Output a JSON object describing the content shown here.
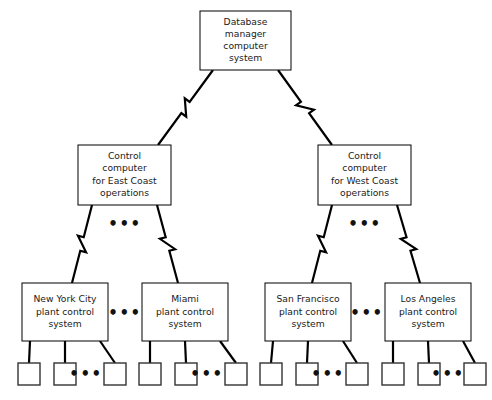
{
  "diagram": {
    "type": "tree-hierarchy",
    "colors": {
      "background": "#ffffff",
      "box_stroke": "#000000",
      "link_stroke": "#000000",
      "text": "#1a1a1a"
    },
    "levels": [
      {
        "level": 1,
        "nodes": [
          {
            "id": "db-manager",
            "name": "database-manager-node",
            "lines": [
              "Database",
              "manager",
              "computer",
              "system"
            ],
            "x": 200,
            "y": 11,
            "w": 91,
            "h": 59
          }
        ]
      },
      {
        "level": 2,
        "nodes": [
          {
            "id": "control-east",
            "name": "control-computer-east-coast-node",
            "lines": [
              "Control",
              "computer",
              "for East Coast",
              "operations"
            ],
            "x": 78,
            "y": 145,
            "w": 93,
            "h": 60
          },
          {
            "id": "control-west",
            "name": "control-computer-west-coast-node",
            "lines": [
              "Control",
              "computer",
              "for West Coast",
              "operations"
            ],
            "x": 318,
            "y": 145,
            "w": 93,
            "h": 60
          }
        ]
      },
      {
        "level": 3,
        "nodes": [
          {
            "id": "plant-nyc",
            "name": "plant-control-new-york-city-node",
            "lines": [
              "New York City",
              "plant control",
              "system"
            ],
            "x": 22,
            "y": 283,
            "w": 86,
            "h": 58
          },
          {
            "id": "plant-miami",
            "name": "plant-control-miami-node",
            "lines": [
              "Miami",
              "plant control",
              "system"
            ],
            "x": 142,
            "y": 283,
            "w": 86,
            "h": 58
          },
          {
            "id": "plant-sf",
            "name": "plant-control-san-francisco-node",
            "lines": [
              "San Francisco",
              "plant control",
              "system"
            ],
            "x": 265,
            "y": 283,
            "w": 86,
            "h": 58
          },
          {
            "id": "plant-la",
            "name": "plant-control-los-angeles-node",
            "lines": [
              "Los Angeles",
              "plant control",
              "system"
            ],
            "x": 385,
            "y": 283,
            "w": 86,
            "h": 58
          }
        ]
      }
    ],
    "leaf_groups": [
      {
        "parent": "plant-nyc",
        "name": "leaf-group-new-york-city",
        "squares": [
          {
            "x": 18,
            "y": 363,
            "size": 22
          },
          {
            "x": 54,
            "y": 363,
            "size": 22
          },
          {
            "x": 104,
            "y": 363,
            "size": 22
          }
        ],
        "ellipsis": {
          "x": 86,
          "y": 374,
          "text": "•••"
        }
      },
      {
        "parent": "plant-miami",
        "name": "leaf-group-miami",
        "squares": [
          {
            "x": 139,
            "y": 363,
            "size": 22
          },
          {
            "x": 175,
            "y": 363,
            "size": 22
          },
          {
            "x": 225,
            "y": 363,
            "size": 22
          }
        ],
        "ellipsis": {
          "x": 207,
          "y": 374,
          "text": "•••"
        }
      },
      {
        "parent": "plant-sf",
        "name": "leaf-group-san-francisco",
        "squares": [
          {
            "x": 260,
            "y": 363,
            "size": 22
          },
          {
            "x": 296,
            "y": 363,
            "size": 22
          },
          {
            "x": 346,
            "y": 363,
            "size": 22
          }
        ],
        "ellipsis": {
          "x": 328,
          "y": 374,
          "text": "•••"
        }
      },
      {
        "parent": "plant-la",
        "name": "leaf-group-los-angeles",
        "squares": [
          {
            "x": 382,
            "y": 363,
            "size": 22
          },
          {
            "x": 418,
            "y": 363,
            "size": 22
          },
          {
            "x": 464,
            "y": 363,
            "size": 22
          }
        ],
        "ellipsis": {
          "x": 448,
          "y": 374,
          "text": "•••"
        }
      }
    ],
    "ellipses": [
      {
        "name": "ellipsis-east-coast-children",
        "x": 125,
        "y": 224,
        "text": "•••"
      },
      {
        "name": "ellipsis-west-coast-children",
        "x": 365,
        "y": 224,
        "text": "•••"
      },
      {
        "name": "ellipsis-between-nyc-miami",
        "x": 125,
        "y": 313,
        "text": "•••"
      },
      {
        "name": "ellipsis-between-sf-la",
        "x": 367,
        "y": 313,
        "text": "•••"
      }
    ],
    "links": {
      "bolt_links": [
        {
          "name": "link-db-to-east-coast",
          "from": "db-manager",
          "to": "control-east"
        },
        {
          "name": "link-db-to-west-coast",
          "from": "db-manager",
          "to": "control-west"
        },
        {
          "name": "link-east-coast-to-nyc",
          "from": "control-east",
          "to": "plant-nyc"
        },
        {
          "name": "link-east-coast-to-miami",
          "from": "control-east",
          "to": "plant-miami"
        },
        {
          "name": "link-west-coast-to-sf",
          "from": "control-west",
          "to": "plant-sf"
        },
        {
          "name": "link-west-coast-to-la",
          "from": "control-west",
          "to": "plant-la"
        }
      ]
    }
  }
}
